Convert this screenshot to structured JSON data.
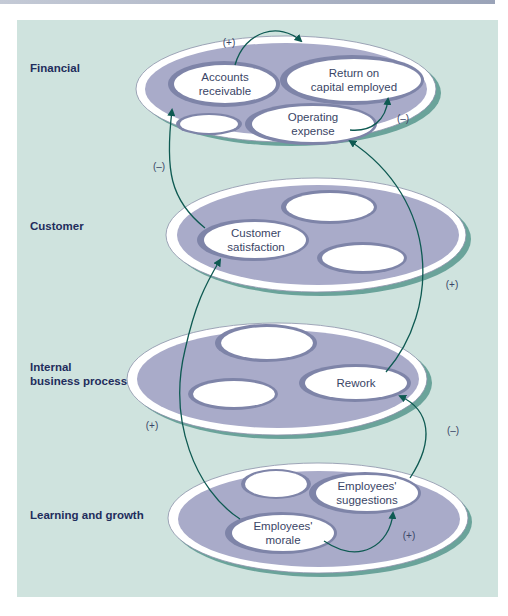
{
  "diagram": {
    "type": "strategy-map-causal-links",
    "colors": {
      "panel_background": "#cfe3de",
      "outer_ellipse_fill": "#a9abc9",
      "outer_ellipse_rim": "#ffffff",
      "inner_ring": "#7e84a8",
      "inner_fill": "#ffffff",
      "shadow": "#6aa39a",
      "arrow": "#0e5a52",
      "label": "#1f2d5c"
    },
    "perspectives": [
      {
        "id": "financial",
        "label": "Financial",
        "nodes": [
          {
            "id": "accounts-receivable",
            "line1": "Accounts",
            "line2": "receivable"
          },
          {
            "id": "return-on-capital",
            "line1": "Return on",
            "line2": "capital employed"
          },
          {
            "id": "blank-1",
            "line1": "",
            "line2": ""
          },
          {
            "id": "operating-expense",
            "line1": "Operating",
            "line2": "expense"
          }
        ]
      },
      {
        "id": "customer",
        "label": "Customer",
        "nodes": [
          {
            "id": "blank-2",
            "line1": "",
            "line2": ""
          },
          {
            "id": "customer-satisfaction",
            "line1": "Customer",
            "line2": "satisfaction"
          },
          {
            "id": "blank-3",
            "line1": "",
            "line2": ""
          }
        ]
      },
      {
        "id": "internal",
        "label_line1": "Internal",
        "label_line2": "business process",
        "nodes": [
          {
            "id": "blank-4",
            "line1": "",
            "line2": ""
          },
          {
            "id": "blank-5",
            "line1": "",
            "line2": ""
          },
          {
            "id": "rework",
            "line1": "Rework",
            "line2": ""
          }
        ]
      },
      {
        "id": "learning",
        "label": "Learning and growth",
        "nodes": [
          {
            "id": "blank-6",
            "line1": "",
            "line2": ""
          },
          {
            "id": "employees-suggestions",
            "line1": "Employees'",
            "line2": "suggestions"
          },
          {
            "id": "employees-morale",
            "line1": "Employees'",
            "line2": "morale"
          }
        ]
      }
    ],
    "links": [
      {
        "from": "accounts-receivable",
        "to": "return-on-capital",
        "sign": "(+)"
      },
      {
        "from": "operating-expense",
        "to": "return-on-capital",
        "sign": "(–)"
      },
      {
        "from": "customer-satisfaction",
        "to": "accounts-receivable",
        "sign": "(–)"
      },
      {
        "from": "rework",
        "to": "operating-expense",
        "sign": "(+)"
      },
      {
        "from": "employees-morale",
        "to": "customer-satisfaction",
        "sign": "(+)"
      },
      {
        "from": "employees-suggestions",
        "to": "rework",
        "sign": "(–)"
      },
      {
        "from": "employees-morale",
        "to": "employees-suggestions",
        "sign": "(+)"
      }
    ]
  }
}
